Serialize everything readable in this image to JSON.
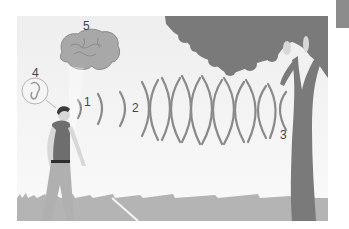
{
  "figure": {
    "labels": [
      {
        "id": "1",
        "text": "1",
        "meaning": "emitted click near mouth"
      },
      {
        "id": "2",
        "text": "2",
        "meaning": "outgoing sound waves"
      },
      {
        "id": "3",
        "text": "3",
        "meaning": "waves reflected by tree"
      },
      {
        "id": "4",
        "text": "4",
        "meaning": "ear"
      },
      {
        "id": "5",
        "text": "5",
        "meaning": "brain"
      }
    ],
    "colors": {
      "sky": "#f2f2f2",
      "tree": "#7a7a7a",
      "ground": "#b4b4b4",
      "waves": "#8a8a8a",
      "brain": "#a8a8a8",
      "shirt": "#6e6e6e",
      "pants": "#b0b0b0",
      "tab": "#8c8c8c"
    }
  }
}
